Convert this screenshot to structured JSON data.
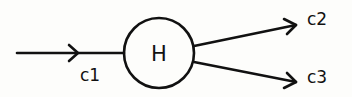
{
  "diagram": {
    "node": {
      "label": "H"
    },
    "edges": [
      {
        "id": "c1",
        "label": "c1",
        "direction": "input"
      },
      {
        "id": "c2",
        "label": "c2",
        "direction": "output"
      },
      {
        "id": "c3",
        "label": "c3",
        "direction": "output"
      }
    ],
    "colors": {
      "stroke": "#111111",
      "background": "#fdfdfb"
    }
  }
}
